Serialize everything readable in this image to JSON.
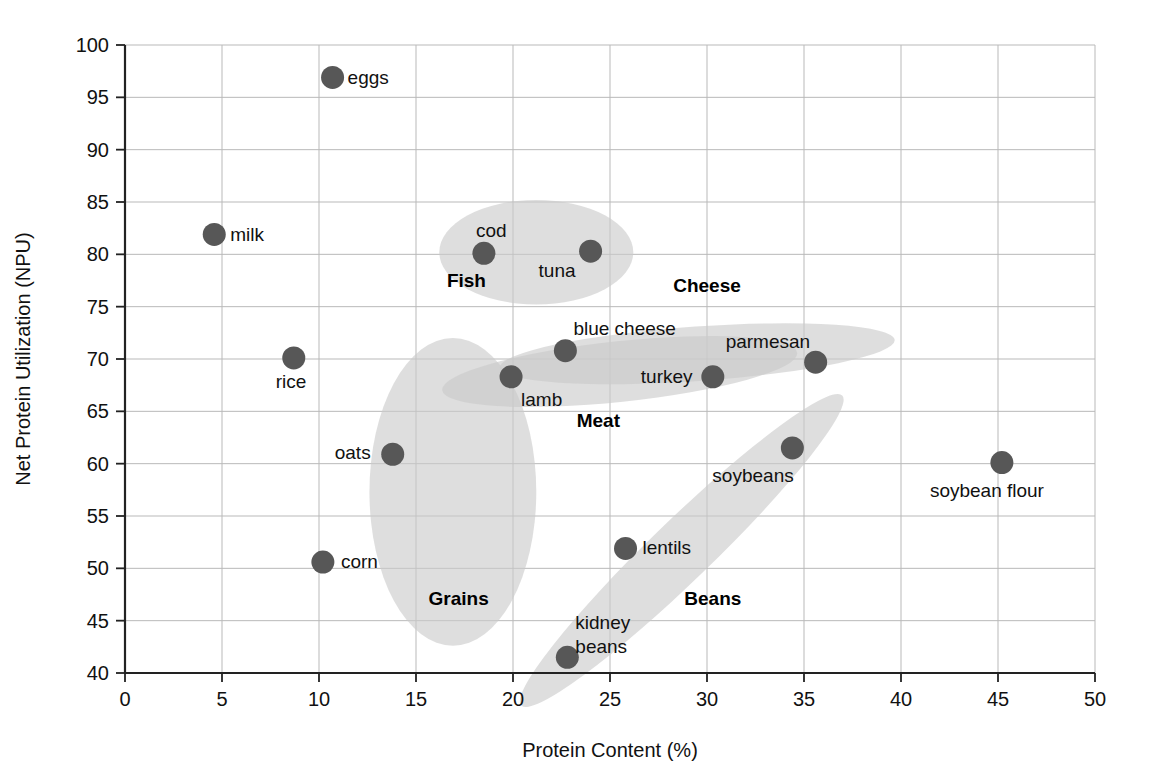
{
  "chart_data": {
    "type": "scatter",
    "title": "",
    "xlabel": "Protein Content (%)",
    "ylabel": "Net Protein Utilization (NPU)",
    "xlim": [
      0,
      50
    ],
    "ylim": [
      40,
      100
    ],
    "xticks": [
      "0",
      "5",
      "10",
      "15",
      "20",
      "25",
      "30",
      "35",
      "40",
      "45",
      "50"
    ],
    "yticks": [
      "40",
      "45",
      "50",
      "55",
      "60",
      "65",
      "70",
      "75",
      "80",
      "85",
      "90",
      "95",
      "100"
    ],
    "grid": true,
    "legend": "none",
    "point_color": "#575757",
    "cluster_color": "#c9c9c9",
    "points": [
      {
        "label": "eggs",
        "x": 10.7,
        "y": 96.9,
        "label_dx": 15,
        "label_dy": 7
      },
      {
        "label": "milk",
        "x": 4.6,
        "y": 81.9,
        "label_dx": 16,
        "label_dy": 7
      },
      {
        "label": "cod",
        "x": 18.5,
        "y": 80.1,
        "label_dx": -8,
        "label_dy": -16
      },
      {
        "label": "tuna",
        "x": 24.0,
        "y": 80.3,
        "label_dx": -52,
        "label_dy": 26
      },
      {
        "label": "rice",
        "x": 8.7,
        "y": 70.1,
        "label_dx": -18,
        "label_dy": 30
      },
      {
        "label": "blue cheese",
        "x": 22.7,
        "y": 70.8,
        "label_dx": 8,
        "label_dy": -16
      },
      {
        "label": "parmesan",
        "x": 35.6,
        "y": 69.7,
        "label_dx": -90,
        "label_dy": -14
      },
      {
        "label": "lamb",
        "x": 19.9,
        "y": 68.3,
        "label_dx": 10,
        "label_dy": 29
      },
      {
        "label": "turkey",
        "x": 30.3,
        "y": 68.3,
        "label_dx": -72,
        "label_dy": 6
      },
      {
        "label": "oats",
        "x": 13.8,
        "y": 60.9,
        "label_dx": -58,
        "label_dy": 5
      },
      {
        "label": "soybeans",
        "x": 34.4,
        "y": 61.5,
        "label_dx": -80,
        "label_dy": 34
      },
      {
        "label": "soybean flour",
        "x": 45.2,
        "y": 60.1,
        "label_dx": -72,
        "label_dy": 34
      },
      {
        "label": "lentils",
        "x": 25.8,
        "y": 51.9,
        "label_dx": 17,
        "label_dy": 6
      },
      {
        "label": "corn",
        "x": 10.2,
        "y": 50.6,
        "label_dx": 18,
        "label_dy": 6
      },
      {
        "label": "kidney beans",
        "x": 22.8,
        "y": 41.5,
        "label_dx": 8,
        "label_dy": -28
      }
    ],
    "clusters": [
      {
        "name": "Grains",
        "cx": 16.9,
        "cy": 57.3,
        "rx": 4.3,
        "ry": 14.7,
        "rot": 0,
        "label_x": 17.2,
        "label_y": 46.5
      },
      {
        "name": "Fish",
        "cx": 21.2,
        "cy": 80.2,
        "rx": 5.0,
        "ry": 5.0,
        "rot": 0,
        "label_x": 17.6,
        "label_y": 76.9
      },
      {
        "name": "Meat",
        "cx": 25.5,
        "cy": 68.8,
        "rx": 9.2,
        "ry": 2.9,
        "rot": -6,
        "label_x": 24.4,
        "label_y": 63.5
      },
      {
        "name": "Cheese",
        "cx": 29.5,
        "cy": 70.5,
        "rx": 10.2,
        "ry": 2.6,
        "rot": -4,
        "label_x": 30.0,
        "label_y": 76.4
      },
      {
        "name": "Beans",
        "cx": 28.7,
        "cy": 51.7,
        "rx": 11.5,
        "ry": 2.9,
        "rot": -44,
        "label_x": 30.3,
        "label_y": 46.5
      }
    ]
  }
}
